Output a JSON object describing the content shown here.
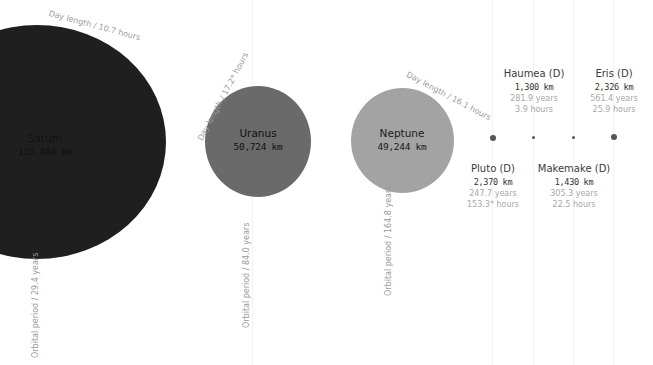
{
  "colors": {
    "saturn": "#1f1f1f",
    "uranus": "#6a6a6a",
    "neptune": "#a3a3a3",
    "dwarf_dot": "#555555",
    "muted_text": "#9a9a9a",
    "orbit_line": "#f3f3f3"
  },
  "planets": [
    {
      "name": "Saturn",
      "diameter": "116,464 km",
      "day_length_label": "Day length / 10.7 hours",
      "orbital_period_label": "Orbital period / 29.4 years"
    },
    {
      "name": "Uranus",
      "diameter": "50,724 km",
      "day_length_label": "Day length / 17.2* hours",
      "orbital_period_label": "Orbital period / 84.0 years"
    },
    {
      "name": "Neptune",
      "diameter": "49,244 km",
      "day_length_label": "Day length / 16.1 hours",
      "orbital_period_label": "Orbital period / 164.8 years"
    }
  ],
  "dwarf_planets": [
    {
      "name": "Pluto (D)",
      "diameter": "2,370 km",
      "orbital_period": "247.7 years",
      "day_length": "153.3* hours"
    },
    {
      "name": "Haumea (D)",
      "diameter": "1,300 km",
      "orbital_period": "281.9 years",
      "day_length": "3.9 hours"
    },
    {
      "name": "Makemake (D)",
      "diameter": "1,430 km",
      "orbital_period": "305.3 years",
      "day_length": "22.5 hours"
    },
    {
      "name": "Eris (D)",
      "diameter": "2,326 km",
      "orbital_period": "561.4 years",
      "day_length": "25.9 hours"
    }
  ]
}
